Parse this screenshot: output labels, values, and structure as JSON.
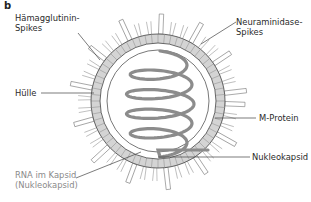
{
  "figure": {
    "panel_letter": "b",
    "labels": {
      "haemagglutinin_line1": "Hämagglutinin-",
      "haemagglutinin_line2": "Spikes",
      "neuraminidase_line1": "Neuraminidase-",
      "neuraminidase_line2": "Spikes",
      "huelle": "Hülle",
      "m_protein": "M-Protein",
      "nukleokapsid": "Nukleokapsid",
      "rna_line1": "RNA im Kapsid",
      "rna_line2": "(Nukleokapsid)"
    },
    "colors": {
      "ring_fill": "#d4d4d4",
      "stroke": "#555555",
      "helix": "#8c8c8c",
      "label_text": "#2a2a2a",
      "rna_label_text": "#8a8a8a"
    },
    "geometry": {
      "center": [
        158,
        101
      ],
      "ring_outer_r": 67,
      "ring_inner_r": 58,
      "inner_membrane_r": 51
    }
  }
}
